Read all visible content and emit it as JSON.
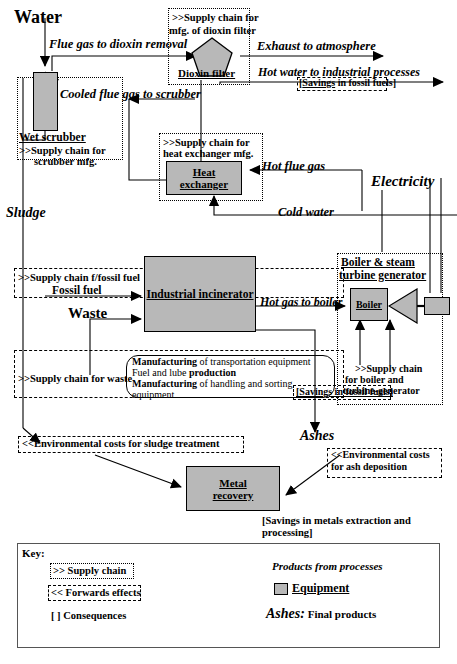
{
  "diagram": {
    "inputs": {
      "water": "Water",
      "sludge": "Sludge",
      "fossil_fuel": "Fossil fuel",
      "waste": "Waste",
      "electricity": "Electricity",
      "ashes": "Ashes"
    },
    "equipment": {
      "dioxin_filter": "Dioxin filter",
      "wet_scrubber": "Wet scrubber",
      "heat_exchanger_l1": "Heat",
      "heat_exchanger_l2": "exchanger",
      "industrial_incinerator": "Industrial incinerator",
      "boiler": "Boiler",
      "metal_recovery_l1": "Metal",
      "metal_recovery_l2": "recovery"
    },
    "supply_chains": {
      "dioxin_l1": ">>Supply chain for",
      "dioxin_l2": "mfg. of dioxin filter",
      "scrubber_l1": ">>Supply chain for",
      "scrubber_l2": "scrubber mfg.",
      "heat_exchanger_l1": ">>Supply chain for",
      "heat_exchanger_l2": "heat exchanger mfg.",
      "fossil_fuel": ">>Supply chain f/fossil fuel",
      "waste": ">>Supply chain for waste",
      "boiler_l1": ">>Supply chain",
      "boiler_l2": "for boiler and",
      "boiler_l3": "turbine-generator"
    },
    "flows": {
      "flue_gas": "Flue gas to dioxin removal",
      "exhaust": "Exhaust to atmosphere",
      "hot_water": "Hot water to industrial processes",
      "cooled_flue_gas": "Cooled flue gas to scrubber",
      "hot_flue_gas": "Hot flue gas",
      "cold_water": "Cold water",
      "hot_gas_to_boiler": "Hot gas to boiler"
    },
    "groups": {
      "boiler_group_l1": "Boiler & steam",
      "boiler_group_l2": "turbine generator"
    },
    "consequences": {
      "savings_fossil_fuels_top_a": "[",
      "savings_fossil_fuels_top_b": "Savings",
      "savings_fossil_fuels_top_c": " in fossil fuels]",
      "savings_fossil_fuels_boiler": "[Savings in fossil fuels]",
      "savings_metals_l1": "[Savings in metals extraction and",
      "savings_metals_l2": "processing]"
    },
    "forward_effects": {
      "sludge_treatment": "<<Environmental costs for sludge treatment",
      "ash_deposition_l1": "<<Environmental costs",
      "ash_deposition_l2": "for ash deposition"
    },
    "manufacturing": {
      "l1_b": "Manufacturing",
      "l1_r": " of transportation equipment",
      "l2_r": "Fuel and lube ",
      "l2_b": "production",
      "l3_b": "Manufacturing",
      "l3_r": " of handling and sorting",
      "l4_r": "equipment"
    },
    "key": {
      "title": "Key:",
      "supply_chain": ">> Supply chain",
      "forwards_effects": "<< Forwards effects",
      "consequences": "[  ] Consequences",
      "products": "Products from processes",
      "equipment": "Equipment",
      "final_products_a": "Ashes:",
      "final_products_b": " Final products"
    },
    "colors": {
      "equipment_fill": "#b8b8b8",
      "stroke": "#000000",
      "key_border": "#555555"
    }
  }
}
